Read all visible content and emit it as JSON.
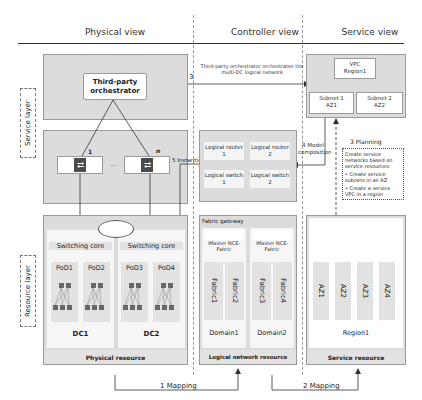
{
  "columns": {
    "physical": "Physical view",
    "controller": "Controller view",
    "service": "Service view"
  },
  "layers": {
    "service": "Service layer",
    "resource": "Resource layer"
  },
  "physical": {
    "orchestrator": "Third-party orchestrator",
    "controller_left_label": "1",
    "controller_right_label": "n",
    "ellipsis": "...",
    "switching_core": "Switching core",
    "pods": [
      "PoD1",
      "PoD2",
      "PoD3",
      "PoD4"
    ],
    "dcs": [
      "DC1",
      "DC2"
    ],
    "footer": "Physical resource"
  },
  "controller": {
    "logical_router_1": "Logical router 1",
    "logical_router_2": "Logical router 2",
    "logical_switch_1": "Logical switch 1",
    "logical_switch_2": "Logical switch 2",
    "fabric_gateway": "Fabric gateway",
    "imaster": "iMaster NCE-Fabric",
    "fabrics": [
      "Fabric1",
      "Fabric2",
      "Fabric3",
      "Fabric4"
    ],
    "domains": [
      "Domain1",
      "Domain2"
    ],
    "footer": "Logical network resource"
  },
  "service": {
    "vpc": "VPC Region1",
    "subnet1": "Subnet 1 AZ1",
    "subnet2": "Subnet 2 AZ2",
    "azs": [
      "AZ1",
      "AZ2",
      "AZ3",
      "AZ4"
    ],
    "region": "Region1",
    "footer": "Service resource"
  },
  "steps": {
    "step3_num": "3",
    "step3_text": "Third-party orchestrator orchestrates the multi-DC logical network",
    "step4": "4 Model composition",
    "step5": "5 Instantiation",
    "planning_title": "3 Planning",
    "planning_intro": "Create service networks based on service resources:",
    "planning_bullets": [
      "Create service subnets in an AZ",
      "Create a service VPC in a region"
    ],
    "mapping1": "1 Mapping",
    "mapping2": "2 Mapping"
  }
}
